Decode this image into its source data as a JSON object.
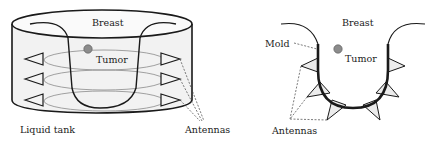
{
  "left_diagram": {
    "title": "Liquid tank setup",
    "labels": {
      "breast": "Breast",
      "tumor": "Tumor",
      "tank": "Liquid tank",
      "antennas": "Antennas"
    }
  },
  "right_diagram": {
    "title": "Mold setup",
    "labels": {
      "breast": "Breast",
      "tumor": "Tumor",
      "mold": "Mold",
      "antennas": "Antennas"
    }
  },
  "colors": {
    "line": "#1a1a1a",
    "tank_fill": "#f2f2f2",
    "ellipse": "#8a8a8a",
    "tumor": "#8c8c8c",
    "antenna_fill": "#ececec",
    "dashed": "#444444"
  }
}
